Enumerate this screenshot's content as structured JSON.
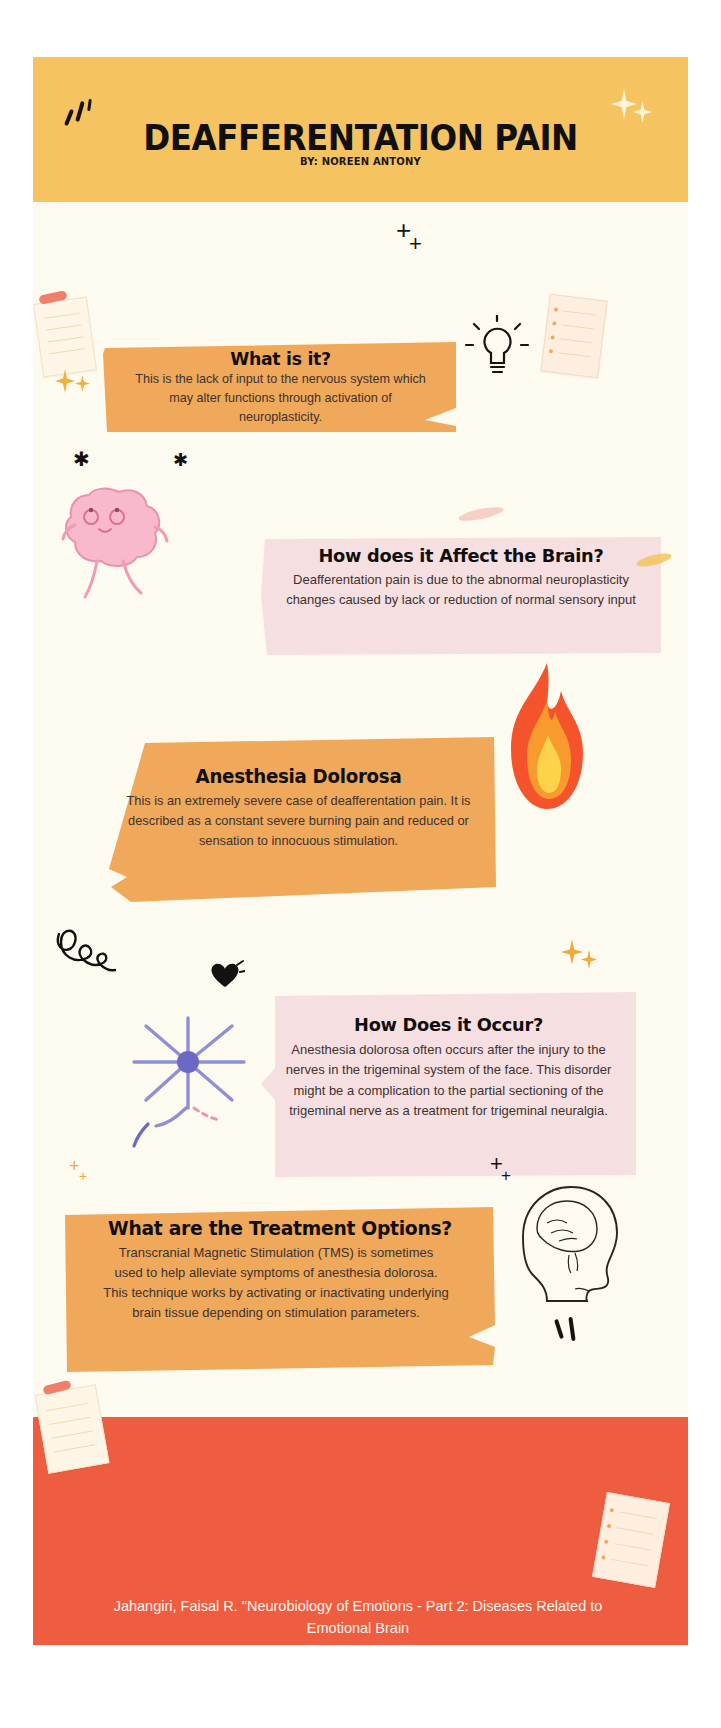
{
  "poster": {
    "title": "DEAFFERENTATION PAIN",
    "byline": "BY: NOREEN ANTONY",
    "colors": {
      "header_band": "#f6c361",
      "background": "#fdfaef",
      "orange_card": "#f0a85a",
      "pink_card": "#f6dfe0",
      "footer_band": "#ee5d3f",
      "title_text": "#111010",
      "body_text": "#3c3330",
      "footer_text": "#fdf4ef"
    }
  },
  "cards": [
    {
      "id": "what-is-it",
      "title": "What is it?",
      "body": "This is the lack of input to the nervous system which may alter functions through activation of neuroplasticity.",
      "color": "orange"
    },
    {
      "id": "affect-the-brain",
      "title": "How does it Affect the Brain?",
      "body": "Deafferentation pain is due to the abnormal neuroplasticity changes caused by lack or reduction of normal sensory input",
      "color": "pink"
    },
    {
      "id": "anesthesia-dolorosa",
      "title": "Anesthesia Dolorosa",
      "body": "This is an extremely severe case of deafferentation pain. It is described as a constant severe burning pain and reduced or sensation to innocuous stimulation.",
      "color": "orange"
    },
    {
      "id": "how-does-it-occur",
      "title": "How Does it Occur?",
      "body": "Anesthesia dolorosa often occurs after the injury to the nerves in the trigeminal system of the face. This disorder might be a complication to the partial sectioning of the trigeminal nerve as a treatment for trigeminal neuralgia.",
      "color": "pink"
    },
    {
      "id": "treatment-options",
      "title": "What are the Treatment Options?",
      "body": "Transcranial Magnetic Stimulation (TMS) is sometimes used to help alleviate symptoms of anesthesia dolorosa. This technique works by activating or inactivating underlying brain tissue depending on stimulation parameters.",
      "color": "orange"
    }
  ],
  "footer": {
    "citation": "Jahangiri, Faisal R. \"Neurobiology of Emotions  - Part 2: Diseases Related to Emotional Brain"
  },
  "illustrations": [
    {
      "name": "lightbulb-icon",
      "near": "what-is-it"
    },
    {
      "name": "sticky-note-icon",
      "near": "what-is-it"
    },
    {
      "name": "grid-paper-note-icon",
      "near": "what-is-it"
    },
    {
      "name": "cartoon-brain-icon",
      "near": "affect-the-brain"
    },
    {
      "name": "flame-icon",
      "near": "anesthesia-dolorosa"
    },
    {
      "name": "neuron-cell-icon",
      "near": "how-does-it-occur"
    },
    {
      "name": "head-anatomy-icon",
      "near": "treatment-options"
    },
    {
      "name": "heart-icon",
      "near": "how-does-it-occur"
    },
    {
      "name": "squiggle-doodle-icon",
      "near": "anesthesia-dolorosa"
    },
    {
      "name": "sparkle-icon",
      "near": "header"
    },
    {
      "name": "plus-doodle-icon",
      "near": "what-is-it"
    }
  ]
}
